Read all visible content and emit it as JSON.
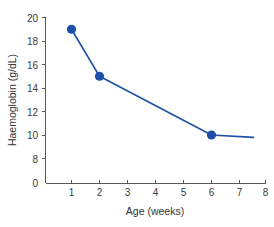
{
  "chart_data": {
    "type": "line",
    "title": "",
    "xlabel": "Age (weeks)",
    "ylabel": "Haemoglobin (g/dL)",
    "x": [
      1,
      2,
      6,
      7.5
    ],
    "values": [
      19,
      15,
      10,
      9.8
    ],
    "markers_at_x": [
      1,
      2,
      6
    ],
    "marker_values": [
      19,
      15,
      10
    ],
    "series": [
      {
        "name": "Haemoglobin",
        "x": [
          1,
          2,
          6,
          7.5
        ],
        "values": [
          19,
          15,
          10,
          9.8
        ],
        "color": "#1f4fa8"
      }
    ],
    "xlim": [
      0.35,
      8
    ],
    "ylim": [
      0,
      20
    ],
    "xticks": [
      1,
      2,
      3,
      4,
      5,
      6,
      7,
      8
    ],
    "xtick_labels": [
      "1",
      "2",
      "3",
      "4",
      "5",
      "6",
      "7",
      "8"
    ],
    "yticks": [
      0,
      8,
      10,
      12,
      14,
      16,
      18,
      20
    ],
    "ytick_labels": [
      "0",
      "8",
      "10",
      "12",
      "14",
      "16",
      "18",
      "20"
    ],
    "y_axis_broken": true,
    "y_break_note": "axis compressed between 0 and 8",
    "grid": false,
    "legend": false,
    "legend_position": "none",
    "marker_shape": "circle",
    "background_color": "#ffffff",
    "axis_color": "#585858",
    "text_color": "#333333"
  },
  "axes": {
    "x_title": "Age (weeks)",
    "y_title": "Haemoglobin (g/dL)"
  }
}
